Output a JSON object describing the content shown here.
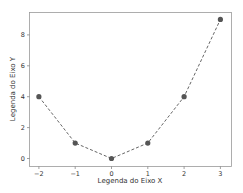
{
  "chart_data": {
    "type": "line",
    "title": "",
    "xlabel": "Legenda do Eixo X",
    "ylabel": "Legenda do Eixo Y",
    "x": [
      -2,
      -1,
      0,
      1,
      2,
      3
    ],
    "series": [
      {
        "name": "",
        "values": [
          4,
          1,
          0,
          1,
          4,
          9
        ]
      }
    ],
    "xticks": [
      "−2",
      "−1",
      "0",
      "1",
      "2",
      "3"
    ],
    "yticks": [
      "0",
      "2",
      "4",
      "6",
      "8"
    ],
    "xlim": [
      -2.25,
      3.25
    ],
    "ylim": [
      -0.45,
      9.45
    ],
    "grid": false,
    "legend": false,
    "line_style": "dashed",
    "marker": "circle",
    "colors": {
      "line": "#666666",
      "marker": "#555555",
      "axes": "#888888"
    }
  }
}
